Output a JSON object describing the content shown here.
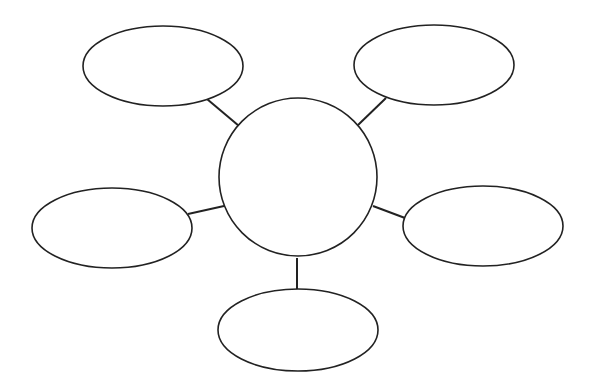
{
  "diagram": {
    "type": "bubble-map",
    "stroke_color": "#222222",
    "background": "#ffffff",
    "center": {
      "label": "",
      "cx": 298,
      "cy": 177,
      "r": 79
    },
    "nodes": [
      {
        "id": "top-left",
        "label": "",
        "cx": 163,
        "cy": 66,
        "rx": 80,
        "ry": 40
      },
      {
        "id": "top-right",
        "label": "",
        "cx": 434,
        "cy": 65,
        "rx": 80,
        "ry": 40
      },
      {
        "id": "middle-left",
        "label": "",
        "cx": 112,
        "cy": 228,
        "rx": 80,
        "ry": 40
      },
      {
        "id": "middle-right",
        "label": "",
        "cx": 483,
        "cy": 226,
        "rx": 80,
        "ry": 40
      },
      {
        "id": "bottom",
        "label": "",
        "cx": 298,
        "cy": 330,
        "rx": 80,
        "ry": 41
      }
    ],
    "connectors": [
      {
        "from": "center",
        "to": "top-left",
        "x1": 239,
        "y1": 126,
        "x2": 207,
        "y2": 99
      },
      {
        "from": "center",
        "to": "top-right",
        "x1": 358,
        "y1": 125,
        "x2": 386,
        "y2": 98
      },
      {
        "from": "center",
        "to": "middle-left",
        "x1": 224,
        "y1": 206,
        "x2": 188,
        "y2": 214
      },
      {
        "from": "center",
        "to": "middle-right",
        "x1": 373,
        "y1": 206,
        "x2": 405,
        "y2": 218
      },
      {
        "from": "center",
        "to": "bottom",
        "x1": 297,
        "y1": 258,
        "x2": 297,
        "y2": 292
      }
    ]
  }
}
